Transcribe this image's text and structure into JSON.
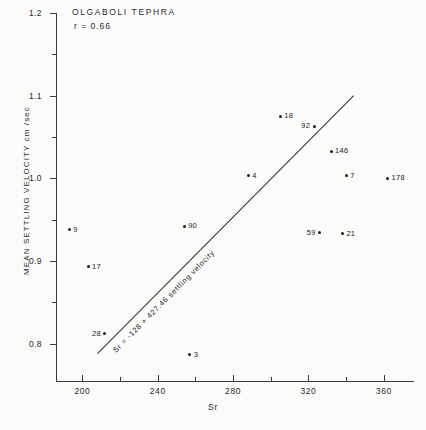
{
  "chart_data": {
    "type": "scatter",
    "title": "OLGABOLI  TEPHRA",
    "correlation": "r = 0.66",
    "xlabel": "Sr",
    "ylabel": "MEAN  SETTLING  VELOCITY   cm /sec",
    "xlim": [
      186,
      376
    ],
    "ylim": [
      0.755,
      1.2
    ],
    "xticks": [
      200,
      240,
      280,
      320,
      360
    ],
    "xtick_labels": [
      "200",
      "240",
      "280",
      "320",
      "360"
    ],
    "xticks_minor": [
      220,
      260,
      300,
      340
    ],
    "yticks": [
      0.8,
      0.9,
      1.0,
      1.1,
      1.2
    ],
    "ytick_labels": [
      "0.8",
      "0.9",
      "1.0",
      "1.1",
      "1.2"
    ],
    "grid": false,
    "legend": "none",
    "points": [
      {
        "label": "9",
        "x": 193,
        "y": 0.938,
        "label_side": "right"
      },
      {
        "label": "17",
        "x": 203,
        "y": 0.893,
        "label_side": "right"
      },
      {
        "label": "28",
        "x": 212,
        "y": 0.812,
        "label_side": "left"
      },
      {
        "label": "90",
        "x": 254,
        "y": 0.942,
        "label_side": "right"
      },
      {
        "label": "3",
        "x": 257,
        "y": 0.787,
        "label_side": "right"
      },
      {
        "label": "4",
        "x": 288,
        "y": 1.003,
        "label_side": "right"
      },
      {
        "label": "18",
        "x": 305,
        "y": 1.075,
        "label_side": "right"
      },
      {
        "label": "92",
        "x": 323,
        "y": 1.063,
        "label_side": "left"
      },
      {
        "label": "59",
        "x": 326,
        "y": 0.934,
        "label_side": "left"
      },
      {
        "label": "146",
        "x": 332,
        "y": 1.033,
        "label_side": "right"
      },
      {
        "label": "21",
        "x": 338,
        "y": 0.933,
        "label_side": "right"
      },
      {
        "label": "7",
        "x": 340,
        "y": 1.003,
        "label_side": "right"
      },
      {
        "label": "178",
        "x": 362,
        "y": 1.0,
        "label_side": "right"
      }
    ],
    "fit_line": {
      "equation": "Sr = -128 + 427.46  settling velocity",
      "x_start": 208,
      "y_start": 0.788,
      "x_end": 344,
      "y_end": 1.1
    }
  }
}
